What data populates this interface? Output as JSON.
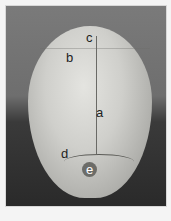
{
  "figure": {
    "labels": {
      "a": "a",
      "b": "b",
      "c": "c",
      "d": "d",
      "e": "e"
    },
    "caption": ""
  },
  "colors": {
    "background": "#f4f4f4",
    "photo_bg_top": "#7a7a7a",
    "photo_bg_bottom": "#2a2a2a",
    "bone": "#cfcfcb"
  }
}
